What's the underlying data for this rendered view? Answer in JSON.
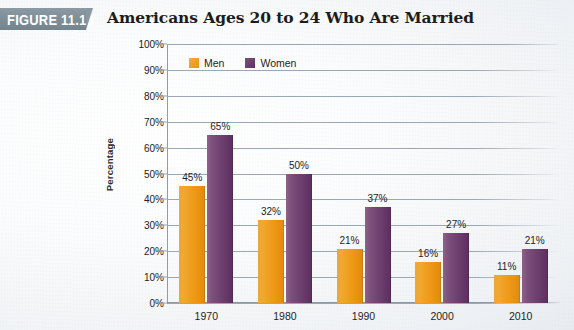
{
  "figure": {
    "badge_label": "FIGURE 11.10"
  },
  "chart_data": {
    "type": "bar",
    "title": "Americans Ages 20 to 24 Who Are Married",
    "xlabel": "",
    "ylabel": "Percentage",
    "ylim": [
      0,
      100
    ],
    "ytick_labels": [
      "0%",
      "10%",
      "20%",
      "30%",
      "40%",
      "50%",
      "60%",
      "70%",
      "80%",
      "90%",
      "100%"
    ],
    "ytick_values": [
      0,
      10,
      20,
      30,
      40,
      50,
      60,
      70,
      80,
      90,
      100
    ],
    "grid": true,
    "legend_position": "top-left",
    "categories": [
      "1970",
      "1980",
      "1990",
      "2000",
      "2010"
    ],
    "series": [
      {
        "name": "Men",
        "color": "#ef9a18",
        "values": [
          45,
          32,
          21,
          16,
          11
        ],
        "labels": [
          "45%",
          "32%",
          "21%",
          "16%",
          "11%"
        ]
      },
      {
        "name": "Women",
        "color": "#6d3f6e",
        "values": [
          65,
          50,
          37,
          27,
          21
        ],
        "labels": [
          "65%",
          "50%",
          "37%",
          "27%",
          "21%"
        ]
      }
    ]
  }
}
